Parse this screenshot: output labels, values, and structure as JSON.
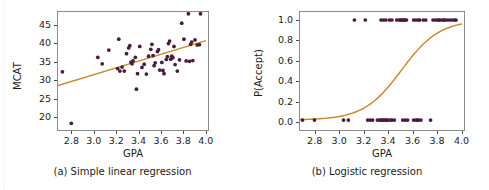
{
  "figure": {
    "background_color": "#ffffff",
    "point_color": "#4a1a3f",
    "line_color": "#c98a2e",
    "frame_color": "#8c8c8c",
    "text_color": "#1b1b1b"
  },
  "chart_data": [
    {
      "type": "scatter",
      "panel": "a",
      "title": "",
      "caption": "(a) Simple linear regression",
      "xlabel": "GPA",
      "ylabel": "MCAT",
      "xlim": [
        2.68,
        4.02
      ],
      "ylim": [
        16.5,
        48.5
      ],
      "xticks": [
        2.8,
        3.0,
        3.2,
        3.4,
        3.6,
        3.8,
        4.0
      ],
      "xtick_labels": [
        "2.8",
        "3.0",
        "3.2",
        "3.4",
        "3.6",
        "3.8",
        "4.0"
      ],
      "yticks": [
        20,
        25,
        30,
        35,
        40,
        45
      ],
      "ytick_labels": [
        "20",
        "25",
        "30",
        "35",
        "40",
        "45"
      ],
      "grid": false,
      "legend": "none",
      "fit_line": {
        "name": "least-squares fit",
        "type": "line",
        "color": "#c98a2e",
        "x": [
          2.68,
          4.02
        ],
        "y": [
          28.2,
          40.6
        ]
      },
      "points": [
        [
          2.72,
          32.0
        ],
        [
          2.8,
          17.8
        ],
        [
          3.04,
          36.0
        ],
        [
          3.08,
          34.2
        ],
        [
          3.14,
          38.0
        ],
        [
          3.22,
          32.9
        ],
        [
          3.23,
          41.0
        ],
        [
          3.24,
          32.2
        ],
        [
          3.26,
          33.3
        ],
        [
          3.28,
          32.2
        ],
        [
          3.3,
          37.0
        ],
        [
          3.32,
          38.6
        ],
        [
          3.33,
          39.2
        ],
        [
          3.34,
          34.7
        ],
        [
          3.35,
          34.2
        ],
        [
          3.36,
          35.0
        ],
        [
          3.38,
          36.0
        ],
        [
          3.39,
          27.2
        ],
        [
          3.4,
          31.5
        ],
        [
          3.42,
          39.0
        ],
        [
          3.44,
          33.2
        ],
        [
          3.46,
          34.1
        ],
        [
          3.48,
          31.4
        ],
        [
          3.5,
          36.3
        ],
        [
          3.52,
          38.2
        ],
        [
          3.53,
          39.6
        ],
        [
          3.54,
          36.5
        ],
        [
          3.55,
          33.7
        ],
        [
          3.56,
          34.5
        ],
        [
          3.58,
          37.6
        ],
        [
          3.59,
          38.1
        ],
        [
          3.6,
          32.5
        ],
        [
          3.62,
          34.6
        ],
        [
          3.63,
          32.4
        ],
        [
          3.64,
          31.5
        ],
        [
          3.66,
          35.4
        ],
        [
          3.67,
          36.2
        ],
        [
          3.68,
          39.8
        ],
        [
          3.69,
          40.5
        ],
        [
          3.7,
          35.5
        ],
        [
          3.71,
          36.3
        ],
        [
          3.72,
          35.9
        ],
        [
          3.73,
          39.0
        ],
        [
          3.74,
          34.0
        ],
        [
          3.76,
          32.2
        ],
        [
          3.78,
          35.3
        ],
        [
          3.8,
          45.4
        ],
        [
          3.82,
          41.0
        ],
        [
          3.84,
          35.0
        ],
        [
          3.86,
          48.0
        ],
        [
          3.87,
          34.9
        ],
        [
          3.88,
          39.6
        ],
        [
          3.89,
          40.2
        ],
        [
          3.9,
          35.1
        ],
        [
          3.92,
          40.8
        ],
        [
          3.94,
          39.4
        ],
        [
          3.96,
          39.5
        ],
        [
          3.97,
          48.0
        ]
      ]
    },
    {
      "type": "scatter",
      "panel": "b",
      "title": "",
      "caption": "(b) Logistic regression",
      "xlabel": "GPA",
      "ylabel": "P(Accept)",
      "xlim": [
        2.68,
        4.02
      ],
      "ylim": [
        -0.08,
        1.08
      ],
      "xticks": [
        2.8,
        3.0,
        3.2,
        3.4,
        3.6,
        3.8,
        4.0
      ],
      "xtick_labels": [
        "2.8",
        "3.0",
        "3.2",
        "3.4",
        "3.6",
        "3.8",
        "4.0"
      ],
      "yticks": [
        0.0,
        0.2,
        0.4,
        0.6,
        0.8,
        1.0
      ],
      "ytick_labels": [
        "0.0",
        "0.2",
        "0.4",
        "0.6",
        "0.8",
        "1.0"
      ],
      "grid": false,
      "legend": "none",
      "fit_curve": {
        "name": "logistic fit",
        "type": "line",
        "color": "#c98a2e",
        "midpoint_x": 3.52,
        "slope_k": 6.4,
        "y_at_x_min": 0.02,
        "y_at_x_max": 0.93
      },
      "points": [
        [
          2.7,
          0.0
        ],
        [
          2.8,
          0.0
        ],
        [
          3.04,
          0.0
        ],
        [
          3.08,
          0.0
        ],
        [
          3.13,
          1.0
        ],
        [
          3.22,
          1.0
        ],
        [
          3.24,
          0.0
        ],
        [
          3.26,
          0.0
        ],
        [
          3.28,
          0.0
        ],
        [
          3.32,
          0.0
        ],
        [
          3.34,
          0.0
        ],
        [
          3.35,
          0.0
        ],
        [
          3.36,
          0.0
        ],
        [
          3.37,
          0.0
        ],
        [
          3.38,
          0.0
        ],
        [
          3.39,
          0.0
        ],
        [
          3.4,
          0.0
        ],
        [
          3.41,
          0.0
        ],
        [
          3.43,
          0.0
        ],
        [
          3.44,
          0.0
        ],
        [
          3.46,
          0.0
        ],
        [
          3.35,
          1.0
        ],
        [
          3.37,
          1.0
        ],
        [
          3.39,
          1.0
        ],
        [
          3.42,
          1.0
        ],
        [
          3.44,
          1.0
        ],
        [
          3.48,
          1.0
        ],
        [
          3.5,
          1.0
        ],
        [
          3.51,
          1.0
        ],
        [
          3.52,
          1.0
        ],
        [
          3.53,
          1.0
        ],
        [
          3.54,
          1.0
        ],
        [
          3.55,
          1.0
        ],
        [
          3.56,
          1.0
        ],
        [
          3.53,
          0.0
        ],
        [
          3.55,
          0.0
        ],
        [
          3.57,
          0.0
        ],
        [
          3.62,
          0.0
        ],
        [
          3.64,
          0.0
        ],
        [
          3.65,
          0.0
        ],
        [
          3.66,
          0.0
        ],
        [
          3.68,
          0.0
        ],
        [
          3.76,
          0.0
        ],
        [
          3.62,
          1.0
        ],
        [
          3.64,
          1.0
        ],
        [
          3.66,
          1.0
        ],
        [
          3.67,
          1.0
        ],
        [
          3.7,
          1.0
        ],
        [
          3.72,
          1.0
        ],
        [
          3.78,
          1.0
        ],
        [
          3.8,
          1.0
        ],
        [
          3.82,
          1.0
        ],
        [
          3.83,
          1.0
        ],
        [
          3.84,
          1.0
        ],
        [
          3.86,
          1.0
        ],
        [
          3.87,
          1.0
        ],
        [
          3.88,
          1.0
        ],
        [
          3.9,
          1.0
        ],
        [
          3.92,
          1.0
        ],
        [
          3.94,
          1.0
        ],
        [
          3.96,
          1.0
        ],
        [
          3.97,
          1.0
        ]
      ]
    }
  ]
}
